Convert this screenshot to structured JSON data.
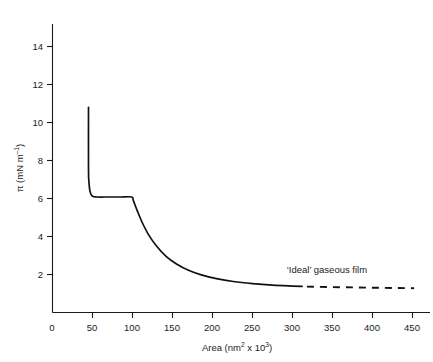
{
  "chart_data": {
    "type": "line",
    "title": "",
    "xlabel": "Area (nm² x 10³)",
    "ylabel": "π (mN m⁻¹)",
    "xlim": [
      0,
      470
    ],
    "ylim": [
      0,
      15.2
    ],
    "grid": false,
    "legend": "none",
    "xticks": [
      0,
      50,
      100,
      150,
      200,
      250,
      300,
      350,
      400,
      450
    ],
    "xtick_labels": [
      "0",
      "50",
      "100",
      "150",
      "200",
      "250",
      "300",
      "350",
      "400",
      "450"
    ],
    "yticks": [
      2,
      4,
      6,
      8,
      10,
      12,
      14
    ],
    "ytick_labels": [
      "2",
      "4",
      "6",
      "8",
      "10",
      "12",
      "14"
    ],
    "series": [
      {
        "name": "surface pressure isotherm",
        "style": "solid",
        "points": [
          [
            45,
            10.8
          ],
          [
            45,
            7.6
          ],
          [
            45.5,
            6.9
          ],
          [
            47,
            6.35
          ],
          [
            50,
            6.12
          ],
          [
            56,
            6.08
          ],
          [
            70,
            6.08
          ],
          [
            85,
            6.08
          ],
          [
            99,
            6.08
          ],
          [
            101,
            5.9
          ],
          [
            106,
            5.35
          ],
          [
            112,
            4.75
          ],
          [
            120,
            4.1
          ],
          [
            130,
            3.5
          ],
          [
            142,
            2.95
          ],
          [
            155,
            2.55
          ],
          [
            170,
            2.22
          ],
          [
            186,
            1.98
          ],
          [
            205,
            1.78
          ],
          [
            226,
            1.63
          ],
          [
            250,
            1.52
          ],
          [
            275,
            1.44
          ],
          [
            300,
            1.39
          ],
          [
            312,
            1.37
          ]
        ]
      },
      {
        "name": "'Ideal' gaseous film",
        "style": "dashed",
        "points": [
          [
            318,
            1.36
          ],
          [
            360,
            1.33
          ],
          [
            410,
            1.3
          ],
          [
            452,
            1.28
          ]
        ]
      }
    ],
    "annotations": [
      {
        "text": "‘Ideal’ gaseous film",
        "x": 343,
        "y": 2.1
      }
    ]
  },
  "axes": {
    "x_title": "Area (nm² x 10³)",
    "x_title_parts": {
      "prefix": "Area (nm",
      "sup1": "2",
      "mid": " x 10",
      "sup2": "3",
      "suffix": ")"
    },
    "y_title": "π (mN m⁻¹)",
    "y_title_parts": {
      "prefix": "π (mN m",
      "sup": "–1",
      "suffix": ")"
    }
  }
}
